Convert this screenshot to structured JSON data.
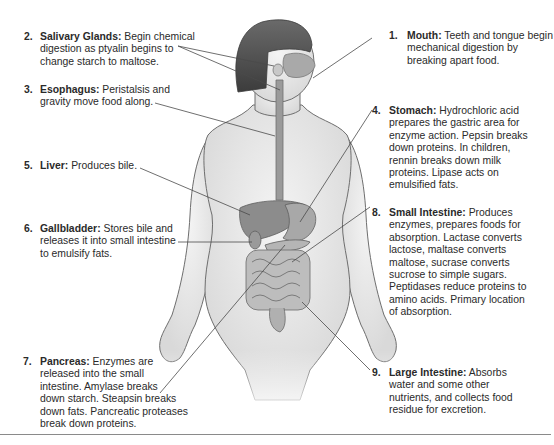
{
  "diagram": {
    "labels": [
      {
        "number": "1.",
        "term": "Mouth:",
        "text": "Teeth and tongue begin mechanical digestion by breaking apart food.",
        "lines": [
          "Teeth and tongue begin",
          "mechanical digestion by",
          "breaking apart food."
        ]
      },
      {
        "number": "2.",
        "term": "Salivary Glands:",
        "text": "Begin chemical digestion as ptyalin begins to change starch to maltose.",
        "lines": [
          "Begin chemical",
          "digestion as ptyalin begins to",
          "change starch to maltose."
        ]
      },
      {
        "number": "3.",
        "term": "Esophagus:",
        "text": "Peristalsis and gravity move food along.",
        "lines": [
          "Peristalsis and",
          "gravity move food along."
        ]
      },
      {
        "number": "4.",
        "term": "Stomach:",
        "text": "Hydrochloric acid prepares the gastric area for enzyme action. Pepsin breaks down proteins. In children, rennin breaks down milk proteins. Lipase acts on emulsified fats.",
        "lines": [
          "Hydrochloric acid",
          "prepares the gastric area for",
          "enzyme action. Pepsin breaks",
          "down proteins. In children,",
          "rennin breaks down milk",
          "proteins. Lipase acts on",
          "emulsified fats."
        ]
      },
      {
        "number": "5.",
        "term": "Liver:",
        "text": "Produces bile.",
        "lines": [
          "Produces bile."
        ]
      },
      {
        "number": "6.",
        "term": "Gallbladder:",
        "text": "Stores bile and releases it into small intestine to emulsify fats.",
        "lines": [
          "Stores bile and",
          "releases it into small intestine",
          "to emulsify fats."
        ]
      },
      {
        "number": "7.",
        "term": "Pancreas:",
        "text": "Enzymes are released into the small intestine. Amylase breaks down starch. Steapsin breaks down fats. Pancreatic proteases break down proteins.",
        "lines": [
          "Enzymes are",
          "released into the small",
          "intestine. Amylase breaks",
          "down starch. Steapsin breaks",
          "down fats. Pancreatic proteases",
          "break down proteins."
        ]
      },
      {
        "number": "8.",
        "term": "Small Intestine:",
        "text": "Produces enzymes, prepares foods for absorption. Lactase converts lactose, maltase converts maltose, sucrase converts sucrose to simple sugars. Peptidases reduce proteins to amino acids. Primary location of absorption.",
        "lines": [
          "Produces",
          "enzymes, prepares foods for",
          "absorption. Lactase converts",
          "lactose, maltase converts",
          "maltose, sucrase converts",
          "sucrose to simple sugars.",
          "Peptidases reduce proteins to",
          "amino acids. Primary location",
          "of absorption."
        ]
      },
      {
        "number": "9.",
        "term": "Large Intestine:",
        "text": "Absorbs water and some other nutrients, and collects food residue for excretion.",
        "lines": [
          "Absorbs",
          "water and some other",
          "nutrients, and collects food",
          "residue for excretion."
        ]
      }
    ],
    "colors": {
      "text": "#2a2a2a",
      "leader_line": "#4a4a4a",
      "hair": "#505050",
      "skin_outline": "#6e6e6e",
      "organ": "#8c8c8c",
      "rule": "#8a8a8a"
    }
  }
}
